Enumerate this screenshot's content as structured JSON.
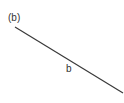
{
  "diagram": {
    "panel_label": "(b)",
    "segment": {
      "label": "b",
      "x1": 15,
      "y1": 27,
      "x2": 123,
      "y2": 93,
      "color": "#3a3a3a"
    }
  }
}
